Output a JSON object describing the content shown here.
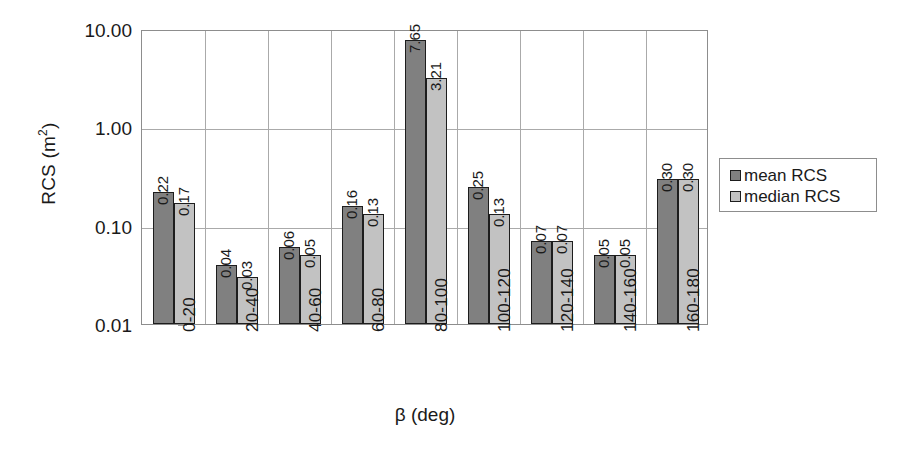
{
  "chart_data": {
    "type": "bar",
    "title": "",
    "xlabel": "β (deg)",
    "ylabel": "RCS (m²)",
    "ylabel_base": "RCS (m",
    "ylabel_sup": "2",
    "ylabel_close": ")",
    "yscale": "log",
    "ylim": [
      0.01,
      10.0
    ],
    "ytick_labels": [
      "10.00",
      "1.00",
      "0.10",
      "0.01"
    ],
    "ytick_values": [
      10.0,
      1.0,
      0.1,
      0.01
    ],
    "grid": "both",
    "legend_position": "right",
    "categories": [
      "0-20",
      "20-40",
      "40-60",
      "60-80",
      "80-100",
      "100-120",
      "120-140",
      "140-160",
      "160-180"
    ],
    "series": [
      {
        "name": "mean RCS",
        "color": "#808080",
        "values": [
          0.22,
          0.04,
          0.06,
          0.16,
          7.65,
          0.25,
          0.07,
          0.05,
          0.3
        ],
        "labels": [
          "0.22",
          "0.04",
          "0.06",
          "0.16",
          "7.65",
          "0.25",
          "0.07",
          "0.05",
          "0.30"
        ]
      },
      {
        "name": "median RCS",
        "color": "#c2c2c2",
        "values": [
          0.17,
          0.03,
          0.05,
          0.13,
          3.21,
          0.13,
          0.07,
          0.05,
          0.3
        ],
        "labels": [
          "0.17",
          "0.03",
          "0.05",
          "0.13",
          "3.21",
          "0.13",
          "0.07",
          "0.05",
          "0.30"
        ]
      }
    ]
  },
  "legend": {
    "entries": [
      {
        "label": "mean RCS",
        "color": "#808080"
      },
      {
        "label": "median RCS",
        "color": "#c2c2c2"
      }
    ]
  },
  "axes": {
    "y_title": "RCS (m",
    "y_title_sup": "2",
    "y_title_tail": ")",
    "x_title": "β (deg)"
  }
}
